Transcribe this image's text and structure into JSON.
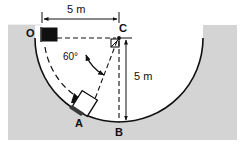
{
  "figure": {
    "colors": {
      "background": "#ffffff",
      "ground_fill": "#d4d4d4",
      "line": "#101010",
      "block_start_fill": "#101010",
      "block_current_fill": "#ffffff"
    },
    "labels": {
      "point_o": "O",
      "point_a": "A",
      "point_b": "B",
      "point_c": "C",
      "dim_horizontal": "5 m",
      "dim_vertical": "5 m",
      "angle": "60°"
    },
    "icons": {
      "start_block": "filled-square-block",
      "sliding_block": "tilted-square-block",
      "motion_arrow": "curved-arrow-along-arc",
      "angle_arrow": "double-headed-arc-arrow",
      "right_angle": "right-angle-marker"
    },
    "geometry": {
      "center": {
        "x": 119,
        "y": 38
      },
      "radius": 84,
      "point_o": {
        "x": 42,
        "y": 38
      },
      "point_b": {
        "x": 119,
        "y": 122
      },
      "angle_deg": 60,
      "ground_rect": {
        "x": 8,
        "y": 25,
        "w": 229,
        "h": 115
      }
    }
  }
}
